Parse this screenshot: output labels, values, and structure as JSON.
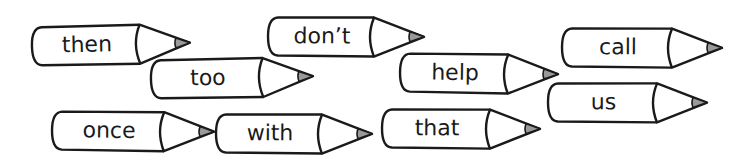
{
  "words": [
    {
      "id": "then",
      "label": "then",
      "x": 30,
      "y": 26,
      "w": 110,
      "tilt": -1.2
    },
    {
      "id": "too",
      "label": "too",
      "x": 149,
      "y": 59,
      "w": 114,
      "tilt": -1.0
    },
    {
      "id": "dont",
      "label": "don’t",
      "x": 266,
      "y": 16,
      "w": 108,
      "tilt": 0.3
    },
    {
      "id": "help",
      "label": "help",
      "x": 398,
      "y": 52,
      "w": 110,
      "tilt": 0.8
    },
    {
      "id": "call",
      "label": "call",
      "x": 560,
      "y": 27,
      "w": 112,
      "tilt": 0.3
    },
    {
      "id": "us",
      "label": "us",
      "x": 546,
      "y": 82,
      "w": 111,
      "tilt": 0.2
    },
    {
      "id": "once",
      "label": "once",
      "x": 50,
      "y": 110,
      "w": 114,
      "tilt": 0.6
    },
    {
      "id": "with",
      "label": "with",
      "x": 214,
      "y": 113,
      "w": 108,
      "tilt": 0.3
    },
    {
      "id": "that",
      "label": "that",
      "x": 380,
      "y": 108,
      "w": 110,
      "tilt": 0.3
    }
  ],
  "colors": {
    "outline": "#1a1a1a",
    "fill": "#ffffff",
    "tip": "#9a9a9a"
  },
  "icon": "pencil-icon"
}
